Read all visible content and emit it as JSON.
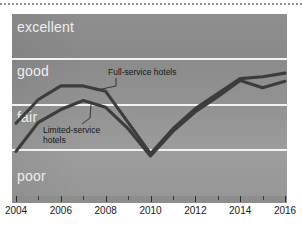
{
  "chart_data": {
    "type": "line",
    "title": "",
    "xlabel": "",
    "ylabel": "",
    "x": [
      2004,
      2005,
      2006,
      2007,
      2008,
      2009,
      2010,
      2011,
      2012,
      2013,
      2014,
      2015,
      2016
    ],
    "xlim": [
      2004,
      2016
    ],
    "xticks": [
      2004,
      2006,
      2008,
      2010,
      2012,
      2014,
      2016
    ],
    "xtick_labels": [
      "2004",
      "2006",
      "2008",
      "2010",
      "2012",
      "2014",
      "2016"
    ],
    "x_minor_ticks": [
      2005,
      2007,
      2009,
      2011,
      2013,
      2015
    ],
    "ylabel_categories": [
      "poor",
      "fair",
      "good",
      "excellent"
    ],
    "yticks_band_edges": [
      0,
      1,
      2,
      3,
      4
    ],
    "ylim": [
      0,
      4
    ],
    "grid": true,
    "legend_position": "inline-annotations",
    "series": [
      {
        "name": "Full-service hotels",
        "color": "#3c3c3c",
        "values": [
          1.6,
          2.12,
          2.42,
          2.42,
          2.3,
          1.62,
          0.93,
          1.48,
          1.92,
          2.25,
          2.58,
          2.62,
          2.7
        ]
      },
      {
        "name": "Limited-service hotels",
        "color": "#3c3c3c",
        "values": [
          0.98,
          1.62,
          1.9,
          2.1,
          1.95,
          1.48,
          0.88,
          1.42,
          1.85,
          2.18,
          2.54,
          2.38,
          2.52
        ]
      }
    ],
    "annotations": [
      {
        "text": "Full-service hotels",
        "lines": [
          "Full-service hotels"
        ]
      },
      {
        "text": "Limited-service hotels",
        "lines": [
          "Limited-service",
          "hotels"
        ]
      }
    ],
    "bands": [
      {
        "label": "excellent",
        "from": 3,
        "to": 4
      },
      {
        "label": "good",
        "from": 2,
        "to": 3
      },
      {
        "label": "fair",
        "from": 1,
        "to": 2
      },
      {
        "label": "poor",
        "from": 0,
        "to": 1
      }
    ],
    "colors": {
      "line": "#3c3c3c",
      "gridline": "#f2f2f2",
      "band_label": "#eeeeee",
      "annotation_text": "#161616",
      "axis": "#8d8d8d",
      "tick": "#2b2b2b",
      "tick_label": "#1b1b1b"
    }
  }
}
